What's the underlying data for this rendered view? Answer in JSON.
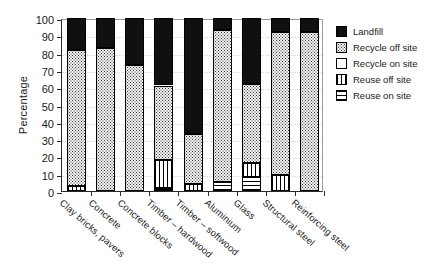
{
  "chart_data": {
    "type": "bar",
    "stacked": true,
    "title": "",
    "xlabel": "",
    "ylabel": "Percentage",
    "ylim": [
      0,
      100
    ],
    "ytick_values": [
      0,
      10,
      20,
      30,
      40,
      50,
      60,
      70,
      80,
      90,
      100
    ],
    "ytick_labels": [
      "0",
      "10",
      "20",
      "30",
      "40",
      "50",
      "60",
      "70",
      "80",
      "90",
      "100"
    ],
    "grid": true,
    "legend_position": "right",
    "categories": [
      "Clay bricks, pavers",
      "Concrete",
      "Concrete blocks",
      "Timber – hardwood",
      "Timber – softwood",
      "Aluminium",
      "Glass",
      "Structural steel",
      "Reinforcing steel"
    ],
    "series": [
      {
        "name": "Reuse on site",
        "pattern": "horizontal-stripes",
        "values": [
          0,
          0,
          0,
          2,
          0,
          5,
          8,
          0,
          0
        ]
      },
      {
        "name": "Reuse off site",
        "pattern": "vertical-stripes",
        "values": [
          3,
          0,
          0,
          16,
          4,
          0,
          8,
          9,
          0
        ]
      },
      {
        "name": "Recycle on site",
        "pattern": "white",
        "values": [
          0,
          0,
          0,
          0,
          0,
          0,
          0,
          0,
          0
        ]
      },
      {
        "name": "Recycle off site",
        "pattern": "dotted",
        "values": [
          78.5,
          82.5,
          73,
          43,
          29,
          88,
          46,
          83,
          92
        ]
      },
      {
        "name": "Landfill",
        "pattern": "solid-black",
        "values": [
          18.5,
          17.5,
          27,
          39,
          67,
          7,
          38,
          8,
          8
        ]
      }
    ],
    "legend": [
      {
        "label": "Landfill",
        "pattern": "solid-black"
      },
      {
        "label": "Recycle off site",
        "pattern": "dotted"
      },
      {
        "label": "Recycle on site",
        "pattern": "white"
      },
      {
        "label": "Reuse off site",
        "pattern": "vertical-stripes"
      },
      {
        "label": "Reuse on site",
        "pattern": "horizontal-stripes"
      }
    ]
  }
}
